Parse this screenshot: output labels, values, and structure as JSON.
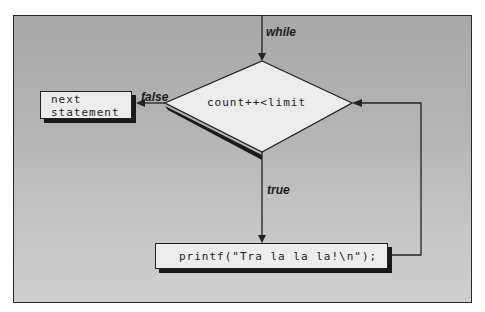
{
  "diagram": {
    "type": "flowchart",
    "entry_label": "while",
    "condition": "count++<limit",
    "true_label": "true",
    "false_label": "false",
    "body_statement": "printf(\"Tra la la la!\\n\");",
    "exit_statement_line1": "next",
    "exit_statement_line2": "statement"
  }
}
